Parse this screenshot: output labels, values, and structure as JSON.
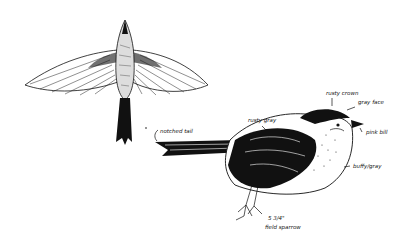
{
  "illustration": {
    "subject": "field sparrow",
    "figures": [
      {
        "name": "flying-sparrow",
        "view": "top view, wings spread"
      },
      {
        "name": "perched-sparrow",
        "view": "side profile"
      }
    ],
    "annotations": {
      "notched_tail": "notched tail",
      "rusty_gray": "rusty gray",
      "rusty_crown": "rusty crown",
      "gray_face": "gray face",
      "pink_bill": "pink bill",
      "buffy_gray": "buffy/gray",
      "size": "5 3/4\"",
      "species": "field sparrow"
    },
    "colors": {
      "ink": "#111111",
      "paper": "#ffffff"
    }
  }
}
